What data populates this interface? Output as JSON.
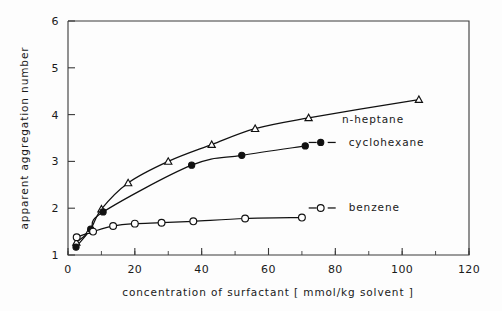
{
  "chart_data": {
    "type": "line",
    "title": "",
    "xlabel": "concentration of surfactant [ mmol/kg solvent ]",
    "ylabel": "apparent aggregation number",
    "xlim": [
      0,
      120
    ],
    "ylim": [
      1,
      6
    ],
    "xticks": [
      0,
      20,
      40,
      60,
      80,
      100,
      120
    ],
    "yticks": [
      1,
      2,
      3,
      4,
      5,
      6
    ],
    "xtick_labels": [
      "0",
      "20",
      "40",
      "60",
      "80",
      "100",
      "120"
    ],
    "ytick_labels": [
      "1",
      "2",
      "3",
      "4",
      "5",
      "6"
    ],
    "x_minor_step": 10,
    "grid": false,
    "legend_position": "inline-right-of-curve",
    "series": [
      {
        "name": "n-heptane",
        "marker": "open-triangle",
        "label_x": 82,
        "label_y": 3.83,
        "points": [
          {
            "x": 2.5,
            "y": 1.27
          },
          {
            "x": 6.5,
            "y": 1.52
          },
          {
            "x": 10.0,
            "y": 1.98
          },
          {
            "x": 18.0,
            "y": 2.54
          },
          {
            "x": 30.0,
            "y": 3.0
          },
          {
            "x": 43.0,
            "y": 3.36
          },
          {
            "x": 56.0,
            "y": 3.7
          },
          {
            "x": 72.0,
            "y": 3.93
          },
          {
            "x": 105.0,
            "y": 4.32
          }
        ]
      },
      {
        "name": "cyclohexane",
        "marker": "filled-circle",
        "label_x": 84,
        "label_y": 3.33,
        "points": [
          {
            "x": 2.4,
            "y": 1.17
          },
          {
            "x": 6.8,
            "y": 1.55
          },
          {
            "x": 10.5,
            "y": 1.92
          },
          {
            "x": 37.0,
            "y": 2.92
          },
          {
            "x": 52.0,
            "y": 3.13
          },
          {
            "x": 71.0,
            "y": 3.33
          }
        ]
      },
      {
        "name": "benzene",
        "marker": "open-circle",
        "label_x": 84,
        "label_y": 1.93,
        "points": [
          {
            "x": 2.6,
            "y": 1.38
          },
          {
            "x": 7.5,
            "y": 1.5
          },
          {
            "x": 13.5,
            "y": 1.62
          },
          {
            "x": 20.0,
            "y": 1.67
          },
          {
            "x": 28.0,
            "y": 1.69
          },
          {
            "x": 37.5,
            "y": 1.72
          },
          {
            "x": 53.0,
            "y": 1.78
          },
          {
            "x": 70.0,
            "y": 1.8
          }
        ]
      }
    ]
  }
}
